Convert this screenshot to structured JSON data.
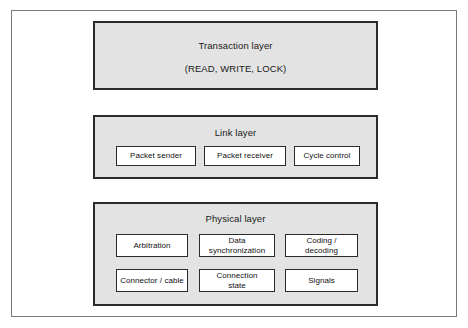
{
  "diagram": {
    "background_color": "#ffffff",
    "frame_color": "#7a7a7a",
    "layer_fill_color": "#e3e3e3",
    "layer_border_color": "#2b2b2b",
    "unit_fill_color": "#ffffff",
    "layers": [
      {
        "id": "transaction-layer",
        "title": "Transaction layer",
        "subtitle": "(READ, WRITE, LOCK)",
        "units": []
      },
      {
        "id": "link-layer",
        "title": "Link layer",
        "subtitle": "",
        "units": [
          {
            "label": "Packet sender"
          },
          {
            "label": "Packet receiver"
          },
          {
            "label": "Cycle control"
          }
        ]
      },
      {
        "id": "physical-layer",
        "title": "Physical layer",
        "subtitle": "",
        "units": [
          {
            "label": "Arbitration"
          },
          {
            "label": "Data\nsynchronization"
          },
          {
            "label": "Coding /\ndecoding"
          },
          {
            "label": "Connector / cable"
          },
          {
            "label": "Connection\nstate"
          },
          {
            "label": "Signals"
          }
        ]
      }
    ]
  }
}
